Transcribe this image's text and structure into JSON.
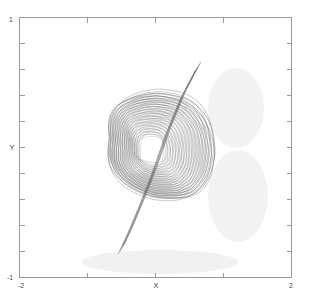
{
  "chart_data": {
    "type": "line",
    "title": "",
    "subtitle": "",
    "xlabel": "X",
    "ylabel": "Y",
    "xlim": [
      -2,
      2
    ],
    "ylim": [
      -1,
      1
    ],
    "grid": false,
    "legend": null,
    "background": "#ffffff",
    "line_color": "#555555",
    "axis_color": "#9a9a9a",
    "x_ticks": [
      -2,
      -1,
      0,
      1,
      2
    ],
    "x_tick_labels": [
      "-2",
      "",
      "X",
      "",
      "2"
    ],
    "y_ticks": [
      -1,
      -0.8,
      -0.6,
      -0.4,
      -0.2,
      0,
      0.2,
      0.4,
      0.6,
      0.8,
      1
    ],
    "y_tick_labels": [
      "-1",
      "",
      "",
      "",
      "",
      "Y",
      "",
      "",
      "",
      "",
      "1"
    ],
    "n_loops": 18,
    "series": [
      {
        "name": "trajectory",
        "comment": "Nested quasi-periodic loops; each loop is a rounded rectangle-ish orbit whose left side pinches inward (concave) and whose right side bulges outward, producing the characteristic spool silhouette.",
        "loop_params": [
          {
            "i": 0,
            "cx": 0.02,
            "cy": 0.02,
            "rx": 0.78,
            "ry": 0.4,
            "pinch": 0.26,
            "rot": -0.06,
            "shade": 0.86,
            "w": 0.85
          },
          {
            "i": 1,
            "cx": 0.015,
            "cy": 0.018,
            "rx": 0.74,
            "ry": 0.38,
            "pinch": 0.26,
            "rot": -0.06,
            "shade": 0.8,
            "w": 0.8
          },
          {
            "i": 2,
            "cx": 0.01,
            "cy": 0.015,
            "rx": 0.7,
            "ry": 0.365,
            "pinch": 0.25,
            "rot": -0.055,
            "shade": 0.74,
            "w": 0.8
          },
          {
            "i": 3,
            "cx": 0.005,
            "cy": 0.012,
            "rx": 0.665,
            "ry": 0.35,
            "pinch": 0.25,
            "rot": -0.055,
            "shade": 0.7,
            "w": 0.75
          },
          {
            "i": 4,
            "cx": 0.0,
            "cy": 0.01,
            "rx": 0.63,
            "ry": 0.335,
            "pinch": 0.24,
            "rot": -0.05,
            "shade": 0.66,
            "w": 0.75
          },
          {
            "i": 5,
            "cx": -0.005,
            "cy": 0.008,
            "rx": 0.595,
            "ry": 0.32,
            "pinch": 0.24,
            "rot": -0.05,
            "shade": 0.62,
            "w": 0.72
          },
          {
            "i": 6,
            "cx": -0.01,
            "cy": 0.005,
            "rx": 0.56,
            "ry": 0.305,
            "pinch": 0.23,
            "rot": -0.045,
            "shade": 0.6,
            "w": 0.72
          },
          {
            "i": 7,
            "cx": -0.015,
            "cy": 0.003,
            "rx": 0.525,
            "ry": 0.29,
            "pinch": 0.23,
            "rot": -0.045,
            "shade": 0.58,
            "w": 0.7
          },
          {
            "i": 8,
            "cx": -0.02,
            "cy": 0.0,
            "rx": 0.49,
            "ry": 0.275,
            "pinch": 0.22,
            "rot": -0.04,
            "shade": 0.56,
            "w": 0.7
          },
          {
            "i": 9,
            "cx": -0.025,
            "cy": -0.002,
            "rx": 0.455,
            "ry": 0.26,
            "pinch": 0.22,
            "rot": -0.04,
            "shade": 0.54,
            "w": 0.68
          },
          {
            "i": 10,
            "cx": -0.03,
            "cy": -0.005,
            "rx": 0.42,
            "ry": 0.245,
            "pinch": 0.21,
            "rot": -0.035,
            "shade": 0.52,
            "w": 0.68
          },
          {
            "i": 11,
            "cx": -0.035,
            "cy": -0.007,
            "rx": 0.385,
            "ry": 0.23,
            "pinch": 0.21,
            "rot": -0.035,
            "shade": 0.5,
            "w": 0.66
          },
          {
            "i": 12,
            "cx": -0.04,
            "cy": -0.01,
            "rx": 0.35,
            "ry": 0.215,
            "pinch": 0.2,
            "rot": -0.03,
            "shade": 0.48,
            "w": 0.66
          },
          {
            "i": 13,
            "cx": -0.045,
            "cy": -0.012,
            "rx": 0.315,
            "ry": 0.2,
            "pinch": 0.19,
            "rot": -0.03,
            "shade": 0.46,
            "w": 0.64
          },
          {
            "i": 14,
            "cx": -0.05,
            "cy": -0.015,
            "rx": 0.28,
            "ry": 0.185,
            "pinch": 0.18,
            "rot": -0.025,
            "shade": 0.45,
            "w": 0.64
          },
          {
            "i": 15,
            "cx": -0.055,
            "cy": -0.017,
            "rx": 0.245,
            "ry": 0.17,
            "pinch": 0.17,
            "rot": -0.025,
            "shade": 0.44,
            "w": 0.62
          },
          {
            "i": 16,
            "cx": -0.06,
            "cy": -0.02,
            "rx": 0.21,
            "ry": 0.155,
            "pinch": 0.16,
            "rot": -0.02,
            "shade": 0.43,
            "w": 0.62
          },
          {
            "i": 17,
            "cx": -0.065,
            "cy": -0.022,
            "rx": 0.175,
            "ry": 0.14,
            "pinch": 0.15,
            "rot": -0.02,
            "shade": 0.42,
            "w": 0.6
          }
        ],
        "fold_strand": {
          "comment": "Dark diagonal strand crossing from upper-right fold down to the lower-left fold region.",
          "points": [
            [
              0.62,
              0.62
            ],
            [
              0.4,
              0.4
            ],
            [
              0.18,
              0.12
            ],
            [
              -0.02,
              -0.18
            ],
            [
              -0.2,
              -0.42
            ],
            [
              -0.36,
              -0.62
            ],
            [
              -0.5,
              -0.78
            ]
          ]
        }
      }
    ]
  },
  "axes": {
    "left_label_top": "1",
    "left_label_bottom": "-1",
    "y_axis_title": "Y",
    "x_label_left": "-2",
    "x_label_right": "2",
    "x_axis_title": "X"
  }
}
